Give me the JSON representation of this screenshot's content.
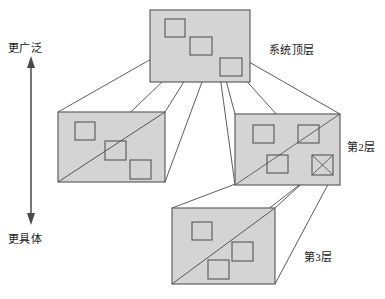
{
  "diagram": {
    "colors": {
      "box_fill": "#d4d4d4",
      "box_stroke": "#555555",
      "inner_stroke": "#555555",
      "line_stroke": "#333333",
      "text": "#1a1a1a",
      "background": "#ffffff"
    },
    "axis": {
      "top_label": "更广泛",
      "bottom_label": "更具体",
      "orientation": "vertical",
      "arrowheads": "both"
    },
    "layers": [
      {
        "id": "top",
        "label": "系统顶层",
        "squares": 3
      },
      {
        "id": "left-second",
        "label": "",
        "squares": 3
      },
      {
        "id": "right-second",
        "label": "第2层",
        "squares": 4
      },
      {
        "id": "third",
        "label": "第3层",
        "squares": 3
      }
    ]
  }
}
